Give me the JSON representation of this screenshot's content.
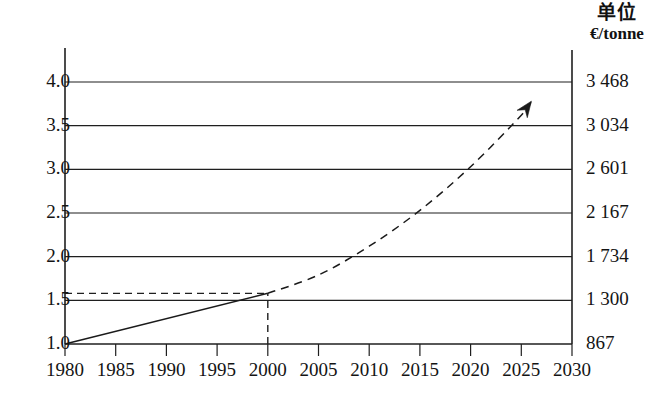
{
  "header": {
    "unit_title_cn": "单位",
    "unit_currency": "€/tonne"
  },
  "chart_data": {
    "type": "line",
    "title": "",
    "subtitle": "",
    "xlabel": "",
    "ylabel": "",
    "ylabel_right": "€/tonne",
    "grid": true,
    "legend_position": "none",
    "xlim": [
      1980,
      2030
    ],
    "ylim": [
      1.0,
      4.0
    ],
    "x_ticks": [
      1980,
      1985,
      1990,
      1995,
      2000,
      2005,
      2010,
      2015,
      2020,
      2025,
      2030
    ],
    "x_ticklabels": [
      "1980",
      "1985",
      "1990",
      "1995",
      "2000",
      "2005",
      "2010",
      "2015",
      "2020",
      "2025",
      "2030"
    ],
    "y_ticks": [
      1.0,
      1.5,
      2.0,
      2.5,
      3.0,
      3.5,
      4.0
    ],
    "y_ticklabels": [
      "1.0",
      "1.5",
      "2.0",
      "2.5",
      "3.0",
      "3.5",
      "4.0"
    ],
    "y_right_ticks": [
      1.0,
      1.5,
      2.0,
      2.5,
      3.0,
      3.5,
      4.0
    ],
    "y_right_ticklabels": [
      "867",
      "1 300",
      "1 734",
      "2 167",
      "2 601",
      "3 034",
      "3 468"
    ],
    "series": [
      {
        "name": "historical",
        "style": "solid",
        "color": "#1a1a1a",
        "x": [
          1980,
          2000
        ],
        "values": [
          1.0,
          1.58
        ]
      },
      {
        "name": "projection",
        "style": "dashed",
        "color": "#1a1a1a",
        "arrow_end": true,
        "x": [
          2000,
          2005,
          2010,
          2015,
          2020,
          2025,
          2026
        ],
        "values": [
          1.58,
          1.79,
          2.12,
          2.53,
          3.03,
          3.62,
          3.78
        ]
      }
    ],
    "annotations": [
      {
        "name": "reference-level-dashed",
        "style": "dashed",
        "orientation": "horizontal",
        "y": 1.58,
        "x_from": 1980,
        "x_to": 2000
      },
      {
        "name": "reference-year-dashed",
        "style": "dashed",
        "orientation": "vertical",
        "x": 2000,
        "y_from": 1.0,
        "y_to": 1.58
      }
    ]
  }
}
